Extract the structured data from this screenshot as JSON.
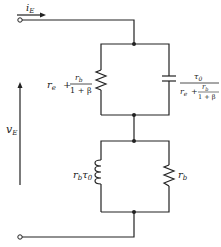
{
  "diagram": {
    "type": "equivalent-circuit",
    "current_label": {
      "main": "i",
      "sub": "E"
    },
    "voltage_label": {
      "main": "v",
      "sub": "E"
    },
    "upper_branch": {
      "resistor_label": {
        "prefix": "r",
        "prefix_sub": "e",
        "plus": "+",
        "num": "r",
        "num_sub": "b",
        "den": "1 + β"
      },
      "capacitor_label": {
        "num": "τ",
        "num_sub": "0",
        "den_prefix": "r",
        "den_prefix_sub": "e",
        "den_plus": "+",
        "den_num": "r",
        "den_num_sub": "b",
        "den_den": "1 + β"
      }
    },
    "lower_branch": {
      "inductor_label": {
        "a": "r",
        "a_sub": "b",
        "b": "τ",
        "b_sub": "0"
      },
      "resistor_label": {
        "main": "r",
        "sub": "b"
      }
    },
    "colors": {
      "ink": "#222222",
      "background": "#ffffff"
    }
  }
}
